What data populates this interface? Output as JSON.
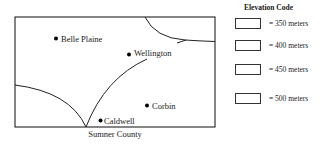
{
  "map": {
    "caption": "Sumner County",
    "cities": [
      {
        "name": "Belle Plaine",
        "x": 56,
        "y": 39
      },
      {
        "name": "Wellington",
        "x": 129,
        "y": 55
      },
      {
        "name": "Corbin",
        "x": 147,
        "y": 106
      },
      {
        "name": "Caldwell",
        "x": 101,
        "y": 120
      }
    ]
  },
  "legend": {
    "title": "Elevation Code",
    "items": [
      {
        "label": "= 350 meters"
      },
      {
        "label": "= 400 meters"
      },
      {
        "label": "= 450 meters"
      },
      {
        "label": "= 500 meters"
      }
    ]
  }
}
